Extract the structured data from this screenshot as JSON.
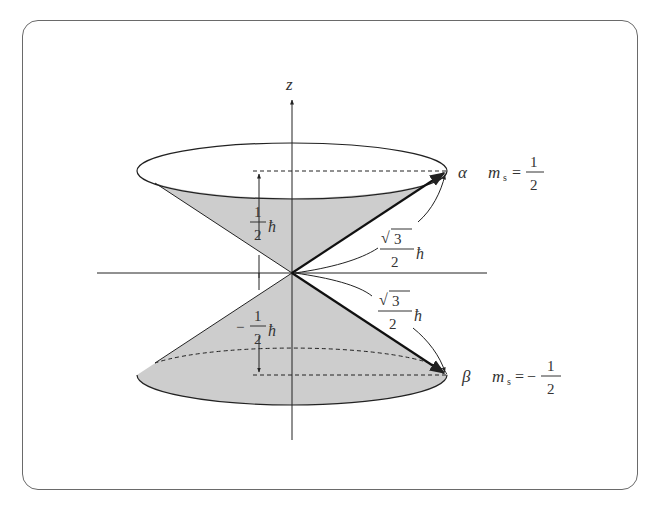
{
  "figure": {
    "type": "spin-angular-momentum-cones",
    "axis_label": "z",
    "states": [
      {
        "symbol": "α",
        "ms_label": "m",
        "ms_sub": "s",
        "ms_eq": "=",
        "ms_sign": "",
        "ms_num": "1",
        "ms_den": "2"
      },
      {
        "symbol": "β",
        "ms_label": "m",
        "ms_sub": "s",
        "ms_eq": "=",
        "ms_sign": "−",
        "ms_num": "1",
        "ms_den": "2"
      }
    ],
    "projections": [
      {
        "sign": "",
        "num": "1",
        "den": "2",
        "unit": "ħ"
      },
      {
        "sign": "−",
        "num": "1",
        "den": "2",
        "unit": "ħ"
      }
    ],
    "magnitudes": [
      {
        "radical": "√",
        "radicand": "3",
        "den": "2",
        "unit": "ħ"
      },
      {
        "radical": "√",
        "radicand": "3",
        "den": "2",
        "unit": "ħ"
      }
    ],
    "colors": {
      "cone_fill": "#cdcdcd",
      "line": "#222222",
      "frame": "#6a6a6a"
    }
  }
}
